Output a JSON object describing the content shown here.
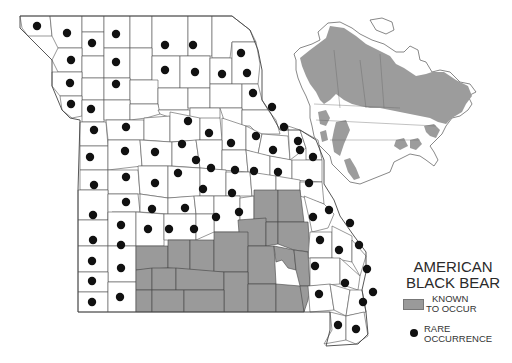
{
  "legend": {
    "title_line1": "AMERICAN",
    "title_line2": "BLACK BEAR",
    "items": [
      {
        "symbol": "gray-swatch",
        "line1": "KNOWN",
        "line2": "TO OCCUR",
        "color": "#9a9a9a"
      },
      {
        "symbol": "black-dot",
        "line1": "RARE",
        "line2": "OCCURRENCE",
        "color": "#111111"
      }
    ]
  },
  "map": {
    "region": "Missouri",
    "inset_region": "North America",
    "colors": {
      "known_range": "#9a9a9a",
      "rare_dot": "#111111",
      "county_fill": "#ffffff",
      "county_stroke": "#555555"
    }
  }
}
